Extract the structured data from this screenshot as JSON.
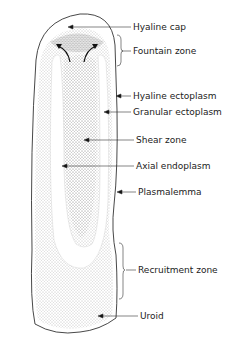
{
  "diagram": {
    "labels": [
      {
        "id": "hyaline-cap",
        "text": "Hyaline cap",
        "x": 133,
        "y": 23
      },
      {
        "id": "fountain-zone",
        "text": "Fountain zone",
        "x": 133,
        "y": 46
      },
      {
        "id": "hyaline-ectoplasm",
        "text": "Hyaline ectoplasm",
        "x": 133,
        "y": 91
      },
      {
        "id": "granular-ectoplasm",
        "text": "Granular ectoplasm",
        "x": 133,
        "y": 108
      },
      {
        "id": "shear-zone",
        "text": "Shear zone",
        "x": 136,
        "y": 136
      },
      {
        "id": "axial-endoplasm",
        "text": "Axial endoplasm",
        "x": 136,
        "y": 162
      },
      {
        "id": "plasmalemma",
        "text": "Plasmalemma",
        "x": 138,
        "y": 188
      },
      {
        "id": "recruitment-zone",
        "text": "Recruitment zone",
        "x": 138,
        "y": 266
      },
      {
        "id": "uroid",
        "text": "Uroid",
        "x": 140,
        "y": 312
      }
    ]
  }
}
